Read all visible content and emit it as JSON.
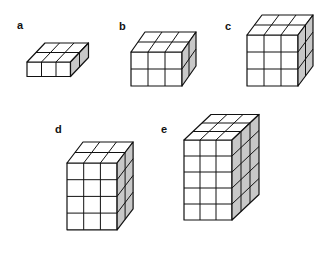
{
  "figure": {
    "panels": [
      {
        "label": "a",
        "cols": 3,
        "rows": 1,
        "depth": 2,
        "label_pos": [
          17,
          19
        ],
        "origin": [
          27,
          62
        ],
        "cell": 14.5,
        "dx": 9,
        "dy": -9.5
      },
      {
        "label": "b",
        "cols": 3,
        "rows": 2,
        "depth": 2,
        "label_pos": [
          119,
          20
        ],
        "origin": [
          131,
          52
        ],
        "cell": 17,
        "dx": 7,
        "dy": -10
      },
      {
        "label": "c",
        "cols": 3,
        "rows": 3,
        "depth": 2,
        "label_pos": [
          225,
          20
        ],
        "origin": [
          247,
          35
        ],
        "cell": 17,
        "dx": 7.5,
        "dy": -10
      },
      {
        "label": "d",
        "cols": 3,
        "rows": 4,
        "depth": 2,
        "label_pos": [
          55,
          123
        ],
        "origin": [
          67,
          163
        ],
        "cell": 16.7,
        "dx": 8,
        "dy": -10.5
      },
      {
        "label": "e",
        "cols": 3,
        "rows": 5,
        "depth": 3,
        "label_pos": [
          161,
          123
        ],
        "origin": [
          184,
          140
        ],
        "cell": 16,
        "dx": 9,
        "dy": -8.5
      }
    ],
    "colors": {
      "line": "#111111",
      "front": "#ffffff",
      "top": "#ffffff",
      "side": "#c8c8c8"
    }
  }
}
